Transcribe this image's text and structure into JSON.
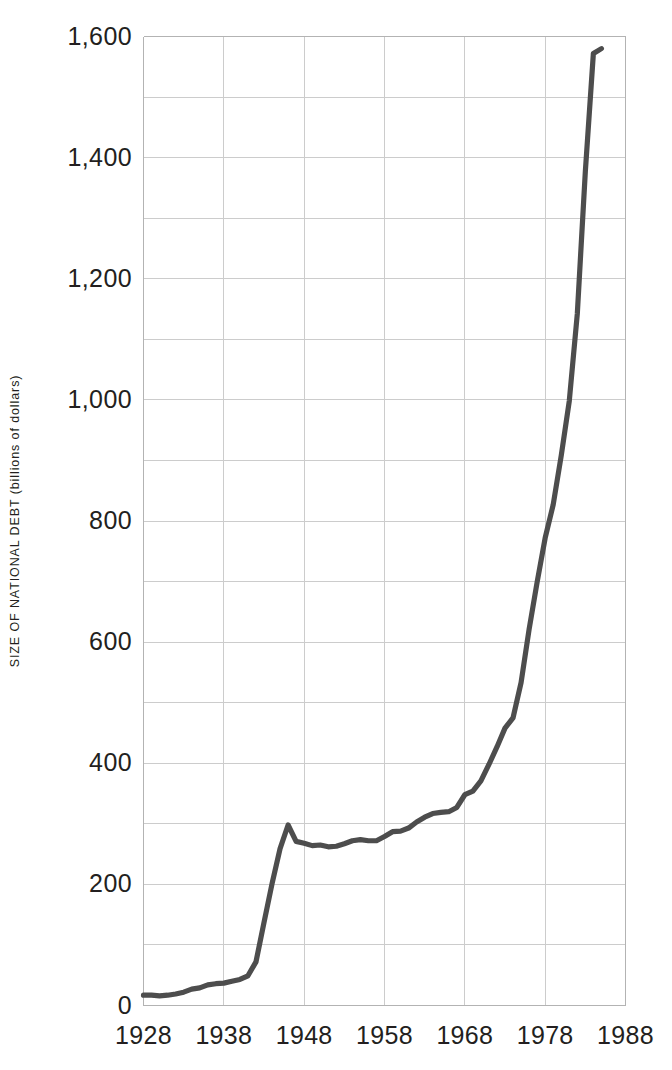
{
  "chart_data": {
    "type": "line",
    "title": "",
    "subtitle": "",
    "xlabel": "",
    "ylabel": "SIZE OF NATIONAL DEBT (billions of dollars)",
    "xlim": [
      1928,
      1988
    ],
    "ylim": [
      0,
      1600
    ],
    "x_ticks": [
      1928,
      1938,
      1948,
      1958,
      1968,
      1978,
      1988
    ],
    "x_tick_labels": [
      "1928",
      "1938",
      "1948",
      "1958",
      "1968",
      "1978",
      "1988"
    ],
    "y_ticks": [
      0,
      200,
      400,
      600,
      800,
      1000,
      1200,
      1400,
      1600
    ],
    "y_tick_labels": [
      "0",
      "200",
      "400",
      "600",
      "800",
      "1,000",
      "1,200",
      "1,400",
      "1,600"
    ],
    "y_minor_step": 100,
    "grid": true,
    "legend": null,
    "legend_position": "none",
    "line_color": "#4d4d4d",
    "grid_color": "#cccccc",
    "axis_color": "#b3b3b3",
    "text_color": "#231f20",
    "background_color": "#ffffff",
    "series": [
      {
        "name": "National debt",
        "x": [
          1928,
          1929,
          1930,
          1931,
          1932,
          1933,
          1934,
          1935,
          1936,
          1937,
          1938,
          1939,
          1940,
          1941,
          1942,
          1943,
          1944,
          1945,
          1946,
          1947,
          1948,
          1949,
          1950,
          1951,
          1952,
          1953,
          1954,
          1955,
          1956,
          1957,
          1958,
          1959,
          1960,
          1961,
          1962,
          1963,
          1964,
          1965,
          1966,
          1967,
          1968,
          1969,
          1970,
          1971,
          1972,
          1973,
          1974,
          1975,
          1976,
          1977,
          1978,
          1979,
          1980,
          1981,
          1982,
          1983,
          1984,
          1985
        ],
        "values": [
          17,
          17,
          16,
          17,
          19,
          22,
          27,
          29,
          34,
          36,
          37,
          40,
          43,
          49,
          72,
          137,
          201,
          259,
          298,
          271,
          268,
          264,
          265,
          262,
          263,
          267,
          272,
          274,
          272,
          272,
          279,
          287,
          288,
          293,
          303,
          311,
          317,
          319,
          320,
          327,
          348,
          354,
          371,
          398,
          427,
          458,
          475,
          533,
          621,
          699,
          772,
          827,
          908,
          998,
          1142,
          1377,
          1572,
          1580
        ]
      }
    ],
    "annotations": [
      {
        "text": "sharp rise during World War II (1941-1946)"
      },
      {
        "text": "plateau through the 1950s near 270 billion"
      },
      {
        "text": "rapid exponential growth after 1975"
      }
    ]
  },
  "axis": {
    "y_title": "SIZE OF NATIONAL DEBT (billions of dollars)"
  }
}
